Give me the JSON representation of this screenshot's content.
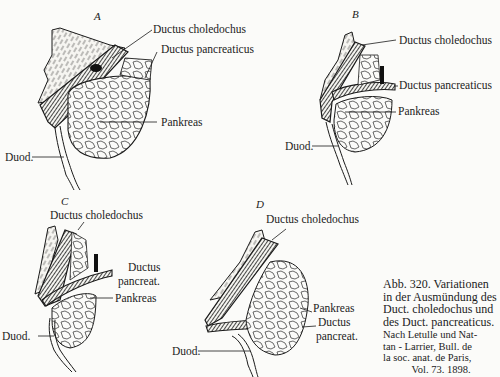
{
  "figures": [
    {
      "id": "A",
      "letter": "A",
      "labels": {
        "choledochus": "Ductus choledochus",
        "pancreaticus": "Ductus pancreaticus",
        "pankreas": "Pankreas",
        "duodenum": "Duod."
      }
    },
    {
      "id": "B",
      "letter": "B",
      "labels": {
        "choledochus": "Ductus choledochus",
        "pancreaticus": "Ductus pancreaticus",
        "pankreas": "Pankreas",
        "duodenum": "Duod."
      }
    },
    {
      "id": "C",
      "letter": "C",
      "labels": {
        "choledochus": "Ductus choledochus",
        "pancreaticus_1": "Ductus",
        "pancreaticus_2": "pancreat.",
        "pankreas": "Pankreas",
        "duodenum": "Duod."
      }
    },
    {
      "id": "D",
      "letter": "D",
      "labels": {
        "choledochus": "Ductus choledochus",
        "pankreas": "Pankreas",
        "pancreaticus_1": "Ductus",
        "pancreaticus_2": "pancreat.",
        "duodenum": "Duod."
      }
    }
  ],
  "caption": {
    "title_lines": [
      "Abb. 320. Variationen",
      "in der Ausmündung des",
      "Duct. choledochus und",
      "des Duct. pancreaticus."
    ],
    "source_lines": [
      "Nach Letulle und Nat-",
      "tan - Larrier, Bull. de",
      "la soc. anat. de Paris,",
      "Vol. 73. 1898."
    ]
  },
  "colors": {
    "paper": "#fbfbf9",
    "ink": "#1a1a1a"
  }
}
